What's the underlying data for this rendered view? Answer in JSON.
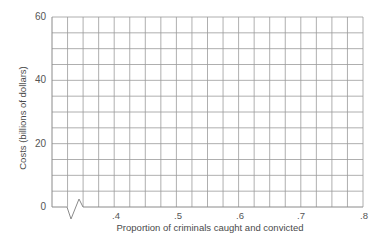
{
  "chart_data": {
    "type": "line",
    "title": "",
    "xlabel": "Proportion of criminals caught and convicted",
    "ylabel": "Costs (billions of dollars)",
    "xlim": [
      0.3,
      0.8
    ],
    "ylim": [
      0,
      60
    ],
    "x_ticks": [
      ".4",
      ".5",
      ".6",
      ".7",
      ".8"
    ],
    "x_tick_values": [
      0.4,
      0.5,
      0.6,
      0.7,
      0.8
    ],
    "y_ticks": [
      "0",
      "20",
      "40",
      "60"
    ],
    "y_tick_values": [
      0,
      20,
      40,
      60
    ],
    "grid": true,
    "grid_x_step": 0.025,
    "grid_y_step": 5,
    "axis_break": "x-axis break near origin",
    "series": []
  },
  "colors": {
    "grid": "#9a9a9a",
    "axis": "#8a8a8a",
    "text": "#4a4a4a"
  }
}
